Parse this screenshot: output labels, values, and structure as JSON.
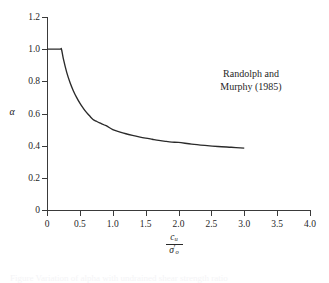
{
  "figure": {
    "background_color": "#ffffff",
    "line_color": "#2a2a2a",
    "text_color": "#1f1f1f"
  },
  "annotation": {
    "line1": "Randolph and",
    "line2": "Murphy (1985)"
  },
  "axes": {
    "y_title": "α",
    "x_title_numerator_symbol": "c",
    "x_title_numerator_subscript": "u",
    "x_title_denominator_symbol": "σ",
    "x_title_denominator_prime": "′",
    "x_title_denominator_subscript": "o",
    "x_title_plain": "c_u / σ'_o"
  },
  "caption": {
    "sliver_text": "Figure   Variation of alpha with undrained shear strength ratio"
  },
  "chart_data": {
    "type": "line",
    "title": "",
    "xlabel": "c_u / σ'_o",
    "ylabel": "α",
    "xlim": [
      0,
      4.0
    ],
    "ylim": [
      0,
      1.2
    ],
    "grid": false,
    "legend_position": "none",
    "x_ticks": [
      0,
      0.5,
      1.0,
      1.5,
      2.0,
      2.5,
      3.0,
      3.5,
      4.0
    ],
    "x_tick_labels": [
      "0",
      "0.5",
      "1.0",
      "1.5",
      "2.0",
      "2.5",
      "3.0",
      "3.5",
      "4.0"
    ],
    "y_ticks": [
      0,
      0.2,
      0.4,
      0.6,
      0.8,
      1.0,
      1.2
    ],
    "y_tick_labels": [
      "0",
      "0.2",
      "0.4",
      "0.6",
      "0.8",
      "1.0",
      "1.2"
    ],
    "annotations": [
      {
        "text": "Randolph and Murphy (1985)",
        "x": 2.4,
        "y": 0.88
      }
    ],
    "series": [
      {
        "name": "Randolph and Murphy (1985)",
        "color": "#2a2a2a",
        "x": [
          0.0,
          0.1,
          0.2,
          0.22,
          0.25,
          0.3,
          0.35,
          0.4,
          0.45,
          0.5,
          0.55,
          0.6,
          0.65,
          0.7,
          0.75,
          0.8,
          0.9,
          1.0,
          1.1,
          1.2,
          1.3,
          1.4,
          1.5,
          1.6,
          1.7,
          1.8,
          1.9,
          2.0,
          2.2,
          2.4,
          2.6,
          2.8,
          3.0
        ],
        "y": [
          1.0,
          1.0,
          1.0,
          1.0,
          0.938,
          0.856,
          0.793,
          0.742,
          0.7,
          0.664,
          0.634,
          0.607,
          0.584,
          0.563,
          0.552,
          0.542,
          0.524,
          0.5,
          0.486,
          0.474,
          0.464,
          0.455,
          0.447,
          0.44,
          0.433,
          0.427,
          0.422,
          0.42,
          0.41,
          0.402,
          0.395,
          0.39,
          0.385
        ]
      }
    ]
  }
}
